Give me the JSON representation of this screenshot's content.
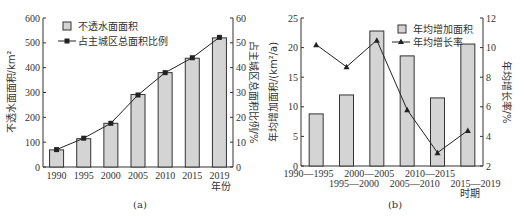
{
  "chart_data": [
    {
      "id": "a",
      "type": "bar",
      "caption": "(a)",
      "categories": [
        "1990",
        "1995",
        "2000",
        "2005",
        "2010",
        "2015",
        "2019"
      ],
      "xlabel": "年份",
      "ylabel": "不透水面面积/km²",
      "ylabel_right": "占主城区总面积比例/%",
      "ylim": [
        0,
        600
      ],
      "yticks": [
        0,
        100,
        200,
        300,
        400,
        500,
        600
      ],
      "ylim_right": [
        0,
        60
      ],
      "yticks_right": [
        0,
        10,
        20,
        30,
        40,
        50,
        60
      ],
      "legend_position": "top-left",
      "grid": false,
      "series": [
        {
          "name": "不透水面面积",
          "kind": "bar",
          "axis": "left",
          "values": [
            69,
            114,
            176,
            292,
            380,
            438,
            520
          ]
        },
        {
          "name": "占主城区总面积比例",
          "kind": "line",
          "marker": "square",
          "axis": "right",
          "values": [
            7.0,
            11.6,
            17.6,
            29.0,
            38.0,
            44.0,
            52.2
          ]
        }
      ],
      "colors": {
        "bar_fill": "#d4d4d4",
        "bar_stroke": "#333333",
        "line": "#222222"
      }
    },
    {
      "id": "b",
      "type": "bar",
      "caption": "(b)",
      "categories": [
        "1990—1995",
        "1995—2000",
        "2000—2005",
        "2005—2010",
        "2010—2015",
        "2015—2019"
      ],
      "xlabel": "时期",
      "ylabel": "年均增加面积/(km²/a)",
      "ylabel_right": "年均增长率/%",
      "ylim": [
        0,
        25
      ],
      "yticks": [
        0,
        5,
        10,
        15,
        20,
        25
      ],
      "ylim_right": [
        2,
        12
      ],
      "yticks_right": [
        2,
        4,
        6,
        8,
        10,
        12
      ],
      "legend_position": "top-right",
      "grid": false,
      "series": [
        {
          "name": "年均增加面积",
          "kind": "bar",
          "axis": "left",
          "values": [
            8.8,
            12.0,
            22.8,
            18.6,
            11.5,
            20.6
          ]
        },
        {
          "name": "年均增长率",
          "kind": "line",
          "marker": "triangle",
          "axis": "right",
          "values": [
            10.2,
            8.7,
            10.5,
            5.8,
            2.9,
            4.4
          ]
        }
      ],
      "colors": {
        "bar_fill": "#d4d4d4",
        "bar_stroke": "#333333",
        "line": "#222222"
      }
    }
  ]
}
